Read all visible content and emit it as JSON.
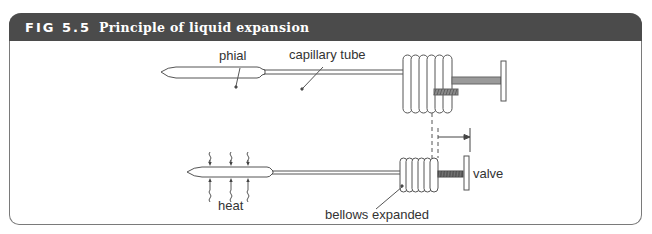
{
  "figure": {
    "number": "FIG 5.5",
    "title": "Principle of liquid expansion"
  },
  "diagram": {
    "top_state": {
      "labels": {
        "phial": "phial",
        "capillary": "capillary tube"
      }
    },
    "bottom_state": {
      "labels": {
        "heat": "heat",
        "bellows": "bellows expanded",
        "valve": "valve"
      }
    }
  },
  "colors": {
    "header_bg": "#4b4b4b",
    "header_text": "#ffffff",
    "line": "#555555",
    "rod_fill": "#9a9a9a",
    "thread_fill": "#5a5a5a",
    "frame_border": "#7a7a7a"
  }
}
